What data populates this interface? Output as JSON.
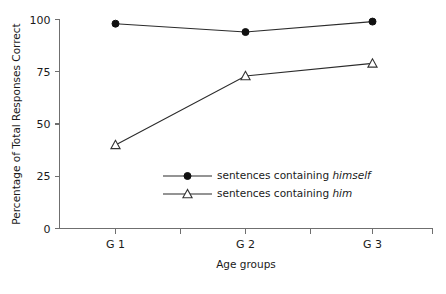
{
  "chart_data": {
    "type": "line",
    "title": "",
    "xlabel": "Age groups",
    "ylabel": "Percentage of Total Responses Correct",
    "categories": [
      "G 1",
      "G 2",
      "G 3"
    ],
    "ylim": [
      0,
      100
    ],
    "yticks": [
      0,
      25,
      50,
      75,
      100
    ],
    "ytick_labels": [
      "0",
      "25",
      "50",
      "75",
      "100"
    ],
    "grid": false,
    "legend_position": "center",
    "series": [
      {
        "name": "sentences containing himself",
        "name_prefix": "sentences containing ",
        "name_emphasis": "himself",
        "marker": "filled-circle",
        "values": [
          98,
          94,
          99
        ]
      },
      {
        "name": "sentences containing him",
        "name_prefix": "sentences containing ",
        "name_emphasis": "him",
        "marker": "open-triangle",
        "values": [
          40,
          73,
          79
        ]
      }
    ]
  },
  "colors": {
    "axis": "#6f6f6f",
    "line": "#2b2b2b",
    "marker_fill": "#111111",
    "marker_open_fill": "#ffffff",
    "text": "#1a1a1a",
    "background": "#ffffff"
  }
}
